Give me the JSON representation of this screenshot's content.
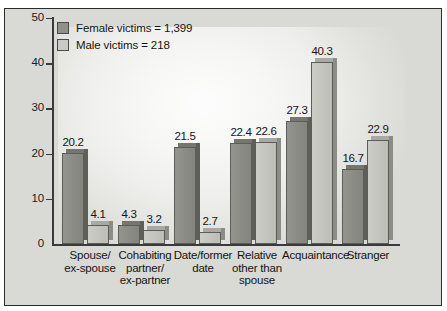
{
  "frame": {
    "top_fragment_left": "",
    "top_fragment_right": ""
  },
  "legend": {
    "position": "top-left inside plot",
    "entries": [
      {
        "label": "Female victims = 1,399",
        "swatch": "dark",
        "color": "#8f8f8c"
      },
      {
        "label": "Male victims = 218",
        "swatch": "light",
        "color": "#c9c9c5"
      }
    ]
  },
  "axis": {
    "y_ticks": [
      "0",
      "10",
      "20",
      "30",
      "40",
      "50"
    ],
    "y_min": 0,
    "y_max": 50
  },
  "chart_data": {
    "type": "bar",
    "title": "",
    "xlabel": "",
    "ylabel": "",
    "ylim": [
      0,
      50
    ],
    "yticks": [
      0,
      10,
      20,
      30,
      40,
      50
    ],
    "grid": false,
    "legend_position": "upper left",
    "categories": [
      "Spouse/\nex-spouse",
      "Cohabiting\npartner/\nex-partner",
      "Date/former\ndate",
      "Relative\nother than\nspouse",
      "Acquaintance",
      "Stranger"
    ],
    "series": [
      {
        "name": "Female victims = 1,399",
        "color": "#8f8f8c",
        "values": [
          20.2,
          4.3,
          21.5,
          22.4,
          27.3,
          16.7
        ],
        "labels": [
          "20.2",
          "4.3",
          "21.5",
          "22.4",
          "27.3",
          "16.7"
        ]
      },
      {
        "name": "Male victims = 218",
        "color": "#c9c9c5",
        "values": [
          4.1,
          3.2,
          2.7,
          22.6,
          40.3,
          22.9
        ],
        "labels": [
          "4.1",
          "3.2",
          "2.7",
          "22.6",
          "40.3",
          "22.9"
        ]
      }
    ]
  },
  "colors": {
    "frame_border": "#2b2b2b",
    "frame_background": "#d9d9d5",
    "axis": "#3a3a3a",
    "text": "#141414"
  }
}
